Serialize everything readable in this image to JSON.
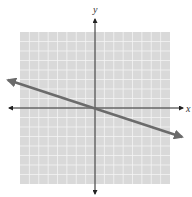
{
  "diagram": {
    "type": "coordinate-plane-graph",
    "axes": {
      "x_label": "x",
      "y_label": "y"
    },
    "grid": {
      "cells_x": 16,
      "cells_y": 16,
      "fill": "#d9d9d9",
      "line_color": "#f2f2f2"
    },
    "line": {
      "description": "line through origin with negative slope",
      "slope": -0.333,
      "color": "#6b6b6b"
    },
    "colors": {
      "axis": "#222222",
      "background": "#ffffff"
    }
  }
}
